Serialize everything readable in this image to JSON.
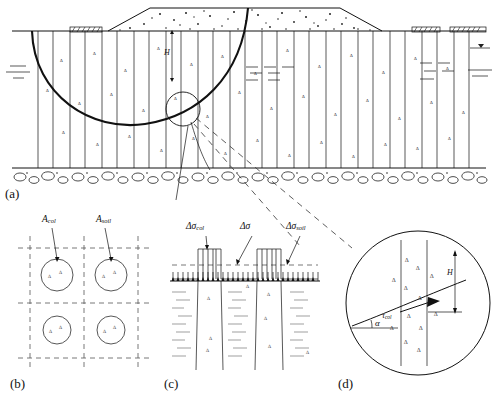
{
  "figure": {
    "panels": [
      {
        "tag": "(a)",
        "name": "embankment-cross-section",
        "description": "Embankment over soft clay reinforced with stone columns, circular slip surface, bedrock below, water table both sides",
        "labels": [
          {
            "text": "H",
            "name": "embankment-height-label"
          }
        ]
      },
      {
        "tag": "(b)",
        "name": "unit-cell-plan-view",
        "description": "Plan view grid of stone columns showing tributary areas",
        "labels": [
          {
            "text": "A",
            "sub": "col",
            "name": "area-column-label"
          },
          {
            "text": "A",
            "sub": "soil",
            "name": "area-soil-label"
          }
        ]
      },
      {
        "tag": "(c)",
        "name": "stress-distribution-diagram",
        "description": "Vertical stress concentration on columns versus surrounding soil",
        "labels": [
          {
            "text": "Δσ",
            "sub": "col",
            "name": "delta-sigma-column-label"
          },
          {
            "text": "Δσ",
            "sub": "",
            "name": "delta-sigma-average-label"
          },
          {
            "text": "Δσ",
            "sub": "soil",
            "name": "delta-sigma-soil-label"
          }
        ]
      },
      {
        "tag": "(d)",
        "name": "shear-detail-circle",
        "description": "Magnified detail of slip surface crossing a stone column with mobilised shear stress and inclination angle",
        "labels": [
          {
            "text": "τ",
            "sub": "col",
            "name": "tau-column-label"
          },
          {
            "text": "α",
            "sub": "",
            "name": "alpha-angle-label"
          },
          {
            "text": "H",
            "sub": "",
            "name": "detail-height-label"
          }
        ]
      }
    ],
    "colors": {
      "line": "#111111",
      "dashed": "#555555",
      "background": "#ffffff",
      "hatch": "#333333"
    }
  },
  "panel_a": {
    "tag": "(a)",
    "height_label": "H"
  },
  "panel_b": {
    "tag": "(b)",
    "area_col": "A",
    "area_col_sub": "col",
    "area_soil": "A",
    "area_soil_sub": "soil"
  },
  "panel_c": {
    "tag": "(c)",
    "sigma_col": "Δσ",
    "sigma_col_sub": "col",
    "sigma_avg": "Δσ",
    "sigma_soil": "Δσ",
    "sigma_soil_sub": "soil"
  },
  "panel_d": {
    "tag": "(d)",
    "tau_col": "τ",
    "tau_col_sub": "col",
    "alpha": "α",
    "height_label": "H"
  }
}
